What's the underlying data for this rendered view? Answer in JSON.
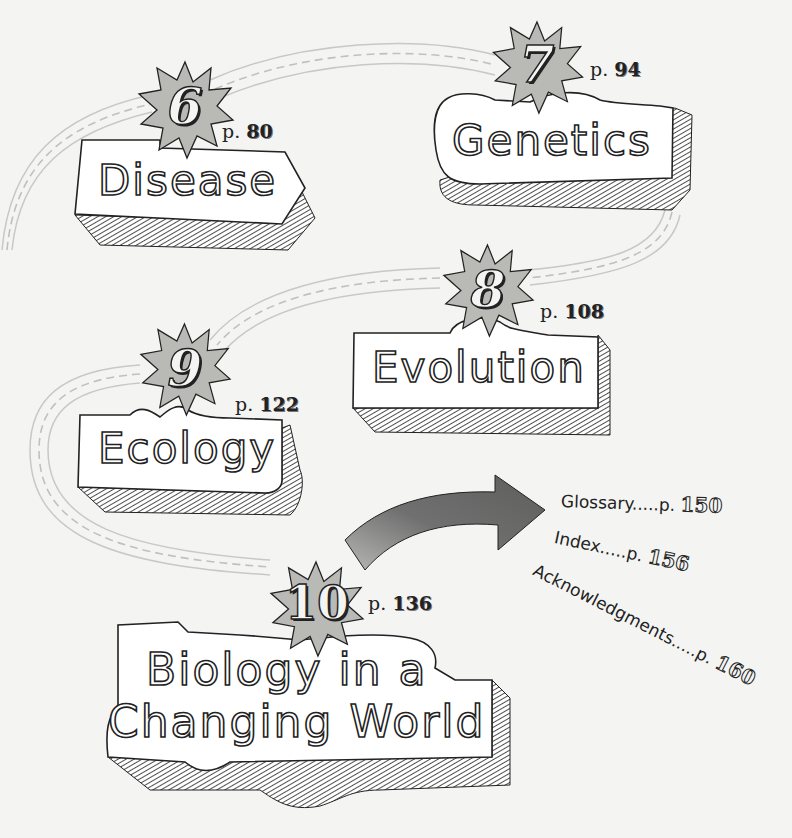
{
  "page": {
    "type": "illustrated table of contents",
    "background": "#f4f4f3"
  },
  "colors": {
    "starburst_fill": "#b9b9b6",
    "ink": "#222222",
    "path_line": "#c8c8c6",
    "arrow_fill": "#6c6c6a",
    "box_fill": "#ffffff"
  },
  "chapters": [
    {
      "number": "6",
      "title": "Disease",
      "page_prefix": "p.",
      "page": "80"
    },
    {
      "number": "7",
      "title": "Genetics",
      "page_prefix": "p.",
      "page": "94"
    },
    {
      "number": "8",
      "title": "Evolution",
      "page_prefix": "p.",
      "page": "108"
    },
    {
      "number": "9",
      "title": "Ecology",
      "page_prefix": "p.",
      "page": "122"
    },
    {
      "number": "10",
      "title_line1": "Biology in a",
      "title_line2": "Changing World",
      "page_prefix": "p.",
      "page": "136"
    }
  ],
  "back_matter": [
    {
      "label": "Glossary.....p.",
      "page": "150"
    },
    {
      "label": "Index.....p.",
      "page": "156"
    },
    {
      "label": "Acknowledgments.....p.",
      "page": "160"
    }
  ],
  "icons": {
    "starburst": "starburst-badge",
    "arrow": "curved-arrow-right"
  }
}
